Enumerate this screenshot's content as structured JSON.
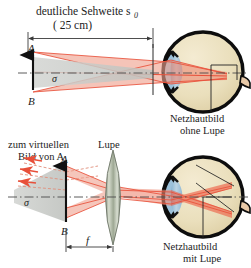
{
  "figure": {
    "title_top_line1": "deutliche Sehweite s",
    "title_top_sub": "0",
    "title_top_line2": "( 25 cm)",
    "label_A_top": "A",
    "label_B_top": "B",
    "label_sigma_top": "σ",
    "label_retina_top_line1": "Netzhautbild",
    "label_retina_top_line2": "ohne Lupe",
    "label_virtual_line1": "zum virtuellen",
    "label_virtual_line2": "Bild von A",
    "label_lupe": "Lupe",
    "label_A_bot": "A",
    "label_B_bot": "B",
    "label_sigma_bot": "σ",
    "label_f": "f",
    "label_retina_bot_line1": "Netzhautbild",
    "label_retina_bot_line2": "mit Lupe"
  },
  "colors": {
    "eye_fill": "#EDE1C0",
    "eye_outline": "#0d0d0d",
    "cornea_fill": "#93BBD6",
    "lens_fill": "#A9C6DA",
    "ray_red": "#E8503A",
    "ray_red_light": "#F3A08C",
    "cone_gray": "#C9CBC8",
    "lupe_fill": "#B9C2B0",
    "axis_gray": "#555555",
    "dim_line": "#3a3a3a",
    "text": "#1c1c1c"
  }
}
